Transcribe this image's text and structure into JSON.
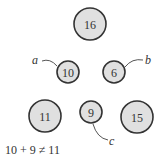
{
  "diagram": {
    "nodes": [
      {
        "id": "n16",
        "value": "16",
        "cx": 90,
        "cy": 24,
        "r": 16
      },
      {
        "id": "n10",
        "value": "10",
        "cx": 68,
        "cy": 72,
        "r": 11
      },
      {
        "id": "n6",
        "value": "6",
        "cx": 114,
        "cy": 72,
        "r": 11
      },
      {
        "id": "n11",
        "value": "11",
        "cx": 45,
        "cy": 116,
        "r": 16
      },
      {
        "id": "n9",
        "value": "9",
        "cx": 91,
        "cy": 112,
        "r": 11
      },
      {
        "id": "n15",
        "value": "15",
        "cx": 137,
        "cy": 117,
        "r": 16
      }
    ],
    "pointers": [
      {
        "label": "a",
        "target": "10"
      },
      {
        "label": "b",
        "target": "6"
      },
      {
        "label": "c",
        "target": "9"
      }
    ],
    "caption": "10 + 9 ≠ 11",
    "colors": {
      "node_fill": "#e0e0e0",
      "node_stroke": "#333333"
    }
  }
}
